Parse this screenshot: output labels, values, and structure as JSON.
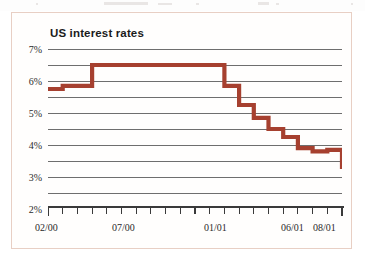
{
  "chart_data": {
    "type": "line",
    "title": "US interest rates",
    "subtitle": "",
    "xlabel": "",
    "ylabel": "",
    "ylim": [
      2,
      7
    ],
    "y_ticks": [
      2,
      3,
      4,
      5,
      6,
      7
    ],
    "y_tick_labels": [
      "2%",
      "3%",
      "4%",
      "5%",
      "6%",
      "7%"
    ],
    "gridlines": [
      2.0,
      2.5,
      3.0,
      3.5,
      4.0,
      4.5,
      5.0,
      5.5,
      6.0,
      6.5,
      7.0
    ],
    "grid": true,
    "legend": "none",
    "step_style": "post",
    "x_tick_count": 20,
    "x_tick_labels": [
      "02/00",
      "07/00",
      "01/01",
      "06/01",
      "08/01"
    ],
    "x_tick_label_positions": [
      0,
      5,
      11,
      16,
      18
    ],
    "x_axis_start": "02/00",
    "x_axis_end": "09/01",
    "series": [
      {
        "name": "US interest rates",
        "color": "#A6402F",
        "x": [
          "02/00",
          "03/00",
          "04/00",
          "05/00",
          "06/00",
          "07/00",
          "08/00",
          "09/00",
          "10/00",
          "11/00",
          "12/00",
          "01/01",
          "02/01",
          "03/01",
          "04/01",
          "05/01",
          "06/01",
          "07/01",
          "08/01",
          "09/01"
        ],
        "values": [
          5.75,
          5.85,
          5.85,
          6.5,
          6.5,
          6.5,
          6.5,
          6.5,
          6.5,
          6.5,
          6.5,
          6.5,
          5.85,
          5.25,
          4.85,
          4.5,
          4.25,
          3.9,
          3.8,
          3.85
        ],
        "final_value": 3.25
      }
    ]
  },
  "chart": {
    "title": "US interest rates",
    "y_labels": [
      "7%",
      "6%",
      "5%",
      "4%",
      "3%",
      "2%"
    ],
    "x_labels": [
      "02/00",
      "07/00",
      "01/01",
      "06/01",
      "08/01"
    ]
  },
  "colors": {
    "line": "#A6402F",
    "grid": "#6e6e6e",
    "frame_border": "#e8cfc4",
    "text": "#1b1b1b",
    "background": "#fffefd"
  }
}
